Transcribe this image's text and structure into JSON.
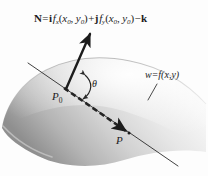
{
  "figure": {
    "background_color": "#fdfdfd",
    "ink_color": "#1c1c1c",
    "surface_light": "#ffffff",
    "surface_shadow": "#9a9a9a"
  },
  "equations": {
    "normal_vector": {
      "lhs": "N",
      "equals": "=",
      "i_unit": "i",
      "fx": "f",
      "fx_sub": "x",
      "fx_args_open": "(",
      "fx_arg1": "x",
      "fx_arg1_sub": "0",
      "fx_comma": ", ",
      "fx_arg2": "y",
      "fx_arg2_sub": "0",
      "fx_args_close": ")",
      "plus": "+",
      "j_unit": "j",
      "fy": "f",
      "fy_sub": "y",
      "fy_args_open": "(",
      "fy_arg1": "x",
      "fy_arg1_sub": "0",
      "fy_comma": ", ",
      "fy_arg2": "y",
      "fy_arg2_sub": "0",
      "fy_args_close": ")",
      "minus": "−",
      "k_unit": "k",
      "plain_text": "N = i fx(x0, y0) + j fy(x0, y0) − k"
    },
    "surface": {
      "w": "w",
      "equals": "=",
      "f": "f",
      "open": "(",
      "x": "x",
      "comma": ",",
      "y": "y",
      "close": ")",
      "plain_text": "w = f(x,y)"
    }
  },
  "labels": {
    "point_p0": "P",
    "point_p0_sub": "0",
    "point_p": "P",
    "angle_theta": "θ"
  },
  "annotations": {
    "normal_arrow": "normal-vector-arrow",
    "tangent_line": "tangent-line",
    "secant_arrow": "dashed-secant-arrow",
    "angle_arc": "theta-angle-arc",
    "leader_line": "surface-label-leader"
  }
}
